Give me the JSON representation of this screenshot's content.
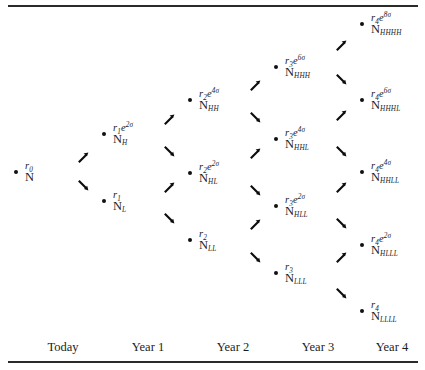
{
  "figure": {
    "type": "binomial-tree-diagram"
  },
  "axis": {
    "columns": [
      {
        "label": "Today",
        "x": 63
      },
      {
        "label": "Year 1",
        "x": 148
      },
      {
        "label": "Year 2",
        "x": 233
      },
      {
        "label": "Year 3",
        "x": 318
      },
      {
        "label": "Year 4",
        "x": 392
      }
    ]
  },
  "nodes": [
    {
      "id": "root",
      "x": 16,
      "y": 172,
      "rate_base": "r",
      "rate_sub": "0",
      "rate_exp": "",
      "count_sub": ""
    },
    {
      "id": "H",
      "x": 104,
      "y": 134,
      "rate_base": "r",
      "rate_sub": "1",
      "rate_exp": "2σ",
      "count_sub": "H"
    },
    {
      "id": "L",
      "x": 104,
      "y": 201,
      "rate_base": "r",
      "rate_sub": "1",
      "rate_exp": "",
      "count_sub": "L"
    },
    {
      "id": "HH",
      "x": 190,
      "y": 100,
      "rate_base": "r",
      "rate_sub": "2",
      "rate_exp": "4σ",
      "count_sub": "HH"
    },
    {
      "id": "HL",
      "x": 190,
      "y": 173,
      "rate_base": "r",
      "rate_sub": "2",
      "rate_exp": "2σ",
      "count_sub": "HL"
    },
    {
      "id": "LL",
      "x": 190,
      "y": 240,
      "rate_base": "r",
      "rate_sub": "2",
      "rate_exp": "",
      "count_sub": "LL"
    },
    {
      "id": "HHH",
      "x": 276,
      "y": 67,
      "rate_base": "r",
      "rate_sub": "3",
      "rate_exp": "6σ",
      "count_sub": "HHH"
    },
    {
      "id": "HHL",
      "x": 276,
      "y": 139,
      "rate_base": "r",
      "rate_sub": "3",
      "rate_exp": "4σ",
      "count_sub": "HHL"
    },
    {
      "id": "HLL",
      "x": 276,
      "y": 206,
      "rate_base": "r",
      "rate_sub": "3",
      "rate_exp": "2σ",
      "count_sub": "HLL"
    },
    {
      "id": "LLL",
      "x": 276,
      "y": 273,
      "rate_base": "r",
      "rate_sub": "3",
      "rate_exp": "",
      "count_sub": "LLL"
    },
    {
      "id": "HHHH",
      "x": 362,
      "y": 24,
      "rate_base": "r",
      "rate_sub": "4",
      "rate_exp": "8σ",
      "count_sub": "HHHH"
    },
    {
      "id": "HHHL",
      "x": 362,
      "y": 100,
      "rate_base": "r",
      "rate_sub": "4",
      "rate_exp": "6σ",
      "count_sub": "HHHL"
    },
    {
      "id": "HHLL",
      "x": 362,
      "y": 172,
      "rate_base": "r",
      "rate_sub": "4",
      "rate_exp": "4σ",
      "count_sub": "HHLL"
    },
    {
      "id": "HLLL",
      "x": 362,
      "y": 245,
      "rate_base": "r",
      "rate_sub": "4",
      "rate_exp": "2σ",
      "count_sub": "HLLL"
    },
    {
      "id": "LLLL",
      "x": 362,
      "y": 311,
      "rate_base": "r",
      "rate_sub": "4",
      "rate_exp": "",
      "count_sub": "LLLL"
    }
  ],
  "count_symbol": "N",
  "exp_symbol": "e",
  "arrows": [
    {
      "from": "root",
      "to": "H",
      "dir": "up",
      "x": 78,
      "y": 152
    },
    {
      "from": "root",
      "to": "L",
      "dir": "down",
      "x": 78,
      "y": 180
    },
    {
      "from": "H",
      "to": "HH",
      "dir": "up",
      "x": 164,
      "y": 114
    },
    {
      "from": "H",
      "to": "HL",
      "dir": "down",
      "x": 164,
      "y": 146
    },
    {
      "from": "L",
      "to": "HL",
      "dir": "up",
      "x": 164,
      "y": 182
    },
    {
      "from": "L",
      "to": "LL",
      "dir": "down",
      "x": 164,
      "y": 213
    },
    {
      "from": "HH",
      "to": "HHH",
      "dir": "up",
      "x": 250,
      "y": 80
    },
    {
      "from": "HH",
      "to": "HHL",
      "dir": "down",
      "x": 250,
      "y": 112
    },
    {
      "from": "HL",
      "to": "HHL",
      "dir": "up",
      "x": 250,
      "y": 148
    },
    {
      "from": "HL",
      "to": "HLL",
      "dir": "down",
      "x": 250,
      "y": 185
    },
    {
      "from": "LL",
      "to": "HLL",
      "dir": "up",
      "x": 250,
      "y": 219
    },
    {
      "from": "LL",
      "to": "LLL",
      "dir": "down",
      "x": 250,
      "y": 252
    },
    {
      "from": "HHH",
      "to": "HHHH",
      "dir": "up",
      "x": 336,
      "y": 40
    },
    {
      "from": "HHH",
      "to": "HHHL",
      "dir": "down",
      "x": 336,
      "y": 74
    },
    {
      "from": "HHL",
      "to": "HHHL",
      "dir": "up",
      "x": 336,
      "y": 110
    },
    {
      "from": "HHL",
      "to": "HHLL",
      "dir": "down",
      "x": 336,
      "y": 146
    },
    {
      "from": "HLL",
      "to": "HHLL",
      "dir": "up",
      "x": 336,
      "y": 182
    },
    {
      "from": "HLL",
      "to": "HLLL",
      "dir": "down",
      "x": 336,
      "y": 218
    },
    {
      "from": "LLL",
      "to": "HLLL",
      "dir": "up",
      "x": 336,
      "y": 252
    },
    {
      "from": "LLL",
      "to": "LLLL",
      "dir": "down",
      "x": 336,
      "y": 288
    }
  ]
}
